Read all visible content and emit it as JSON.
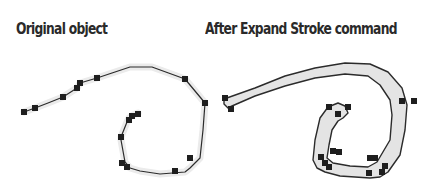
{
  "captions": {
    "left": "Original object",
    "right": "After Expand Stroke command"
  },
  "colors": {
    "path_stroke": "#2b2b2b",
    "anchor_fill": "#1e1e1e",
    "expanded_fill": "#e4e4e4",
    "halo": "#e9e9e9"
  },
  "figures": [
    {
      "name": "original-object",
      "type": "open-path",
      "anchor_count": 14
    },
    {
      "name": "expanded-stroke-object",
      "type": "closed-outline-path",
      "anchor_count": 16
    }
  ]
}
